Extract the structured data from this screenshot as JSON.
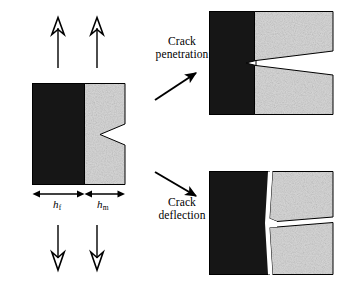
{
  "figure": {
    "title": "Crack penetration versus crack deflection at a bimaterial interface",
    "description": "A notched two-layer specimen under uniaxial tension branches into two outcomes: the crack penetrating through the interface, or the crack deflecting along the interface."
  },
  "specimen": {
    "name": "bimaterial-specimen",
    "layers": [
      {
        "id": "fiber",
        "label": "h",
        "subscript": "f",
        "fill": "#191919",
        "role": "dark-layer"
      },
      {
        "id": "matrix",
        "label": "h",
        "subscript": "m",
        "fill": "#d8d8d8",
        "role": "light-layer"
      }
    ],
    "notch": {
      "name": "v-notch",
      "side": "right",
      "shape": "wedge"
    },
    "load": {
      "type": "uniaxial tension",
      "top_arrows": 2,
      "bottom_arrows": 2,
      "arrow_head_style": "hollow"
    },
    "dimensions": [
      {
        "id": "h_f",
        "label": "h",
        "subscript": "f",
        "meaning": "dark layer thickness"
      },
      {
        "id": "h_m",
        "label": "h",
        "subscript": "m",
        "meaning": "light layer thickness"
      }
    ]
  },
  "branches": [
    {
      "id": "penetration",
      "caption_line1": "Crack",
      "caption_line2": "penetration",
      "arrow": {
        "name": "penetration-arrow",
        "direction": "up-right",
        "head_style": "solid"
      },
      "panel": {
        "name": "penetration-panel",
        "crack": "wedge opening from right edge, tip crossing the interface into the dark layer"
      }
    },
    {
      "id": "deflection",
      "caption_line1": "Crack",
      "caption_line2": "deflection",
      "arrow": {
        "name": "deflection-arrow",
        "direction": "down-right",
        "head_style": "solid"
      },
      "panel": {
        "name": "deflection-panel",
        "crack": "crack turned along the interface, splitting the light layer into two rotated wedges"
      }
    }
  ],
  "colors": {
    "dark_material": "#191919",
    "light_material": "#d8d8d8",
    "outline": "#000000",
    "background": "#ffffff"
  }
}
